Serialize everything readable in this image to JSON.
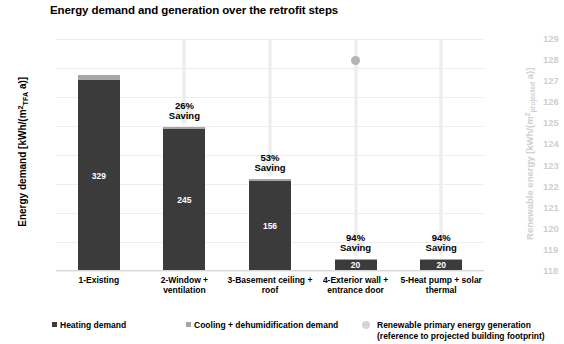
{
  "chart_data": {
    "type": "bar",
    "title": "Energy demand and generation over the retrofit steps",
    "xlabel": "",
    "ylabel": "Energy demand [kWh/(m²TFA a)]",
    "ylabel_right": "Renewable energy [kWh/(m²projected a)]",
    "ylim": [
      0,
      400
    ],
    "ylim_right": [
      118,
      129
    ],
    "grid": true,
    "legend_position": "bottom",
    "categories": [
      "1-Existing",
      "2-Window + ventilation",
      "3-Basement ceiling + roof",
      "4-Exterior wall + entrance door",
      "5-Heat pump + solar thermal"
    ],
    "series": [
      {
        "name": "Heating demand",
        "color": "#3b3b3b",
        "values": [
          329,
          245,
          156,
          20,
          20
        ]
      },
      {
        "name": "Cooling + dehumidification demand",
        "color": "#a6a6a6",
        "values": [
          9,
          3,
          2,
          1,
          1
        ]
      },
      {
        "name": "Renewable primary energy generation (reference to projected building footprint)",
        "color": "#b5b5b5",
        "type": "scatter",
        "axis": "right",
        "values": [
          null,
          null,
          null,
          128,
          null
        ]
      }
    ],
    "bar_value_labels": [
      "329",
      "245",
      "156",
      "20",
      "20"
    ],
    "annotations": [
      {
        "category_index": 1,
        "percent": "26%",
        "word": "Saving"
      },
      {
        "category_index": 2,
        "percent": "53%",
        "word": "Saving"
      },
      {
        "category_index": 3,
        "percent": "94%",
        "word": "Saving"
      },
      {
        "category_index": 4,
        "percent": "94%",
        "word": "Saving"
      }
    ],
    "yticks_left": [
      "400",
      "350",
      "300",
      "250",
      "200",
      "150",
      "100",
      "50",
      "0"
    ],
    "yticks_right": [
      "129",
      "128",
      "127",
      "126",
      "125",
      "124",
      "123",
      "122",
      "121",
      "120",
      "119",
      "118"
    ]
  },
  "axis": {
    "left_title_main": "Energy demand [kWh/(m",
    "left_title_sup": "2",
    "left_title_sub": "TFA",
    "left_title_tail": " a)]",
    "right_title_main": "Renewable energy [kWh/(m",
    "right_title_sup": "2",
    "right_title_sub": "projected",
    "right_title_tail": " a)]"
  },
  "legend": {
    "items": [
      {
        "label": "Heating demand",
        "color": "#3b3b3b",
        "marker": "square-swatch-icon"
      },
      {
        "label": "Cooling + dehumidification demand",
        "color": "#a6a6a6",
        "marker": "square-swatch-icon"
      },
      {
        "label": "Renewable primary energy generation",
        "label2": "(reference to projected building footprint)",
        "color": "#d4d4d4",
        "marker": "circle-swatch-icon"
      }
    ]
  },
  "colors": {
    "heating": "#3b3b3b",
    "cooling": "#a6a6a6",
    "renewable": "#b5b5b5",
    "grid": "#eeeeee",
    "right_axis_text": "#cfcfcf",
    "arrow": "#ededed"
  }
}
